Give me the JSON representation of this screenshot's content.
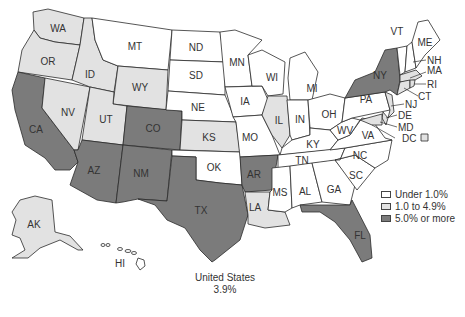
{
  "colors": {
    "low": "#ffffff",
    "mid": "#e2e2e2",
    "high": "#7b7b7b",
    "border": "#2b2b2b"
  },
  "legend": {
    "items": [
      {
        "label": "Under 1.0%",
        "category": "low"
      },
      {
        "label": "1.0 to 4.9%",
        "category": "mid"
      },
      {
        "label": "5.0% or more",
        "category": "high"
      }
    ]
  },
  "national": {
    "name": "United States",
    "value": "3.9%"
  },
  "states": {
    "WA": "mid",
    "OR": "mid",
    "CA": "high",
    "NV": "mid",
    "ID": "mid",
    "MT": "low",
    "WY": "mid",
    "UT": "mid",
    "AZ": "high",
    "CO": "high",
    "NM": "high",
    "ND": "low",
    "SD": "low",
    "NE": "low",
    "KS": "mid",
    "OK": "low",
    "TX": "high",
    "MN": "low",
    "IA": "low",
    "MO": "low",
    "AR": "high",
    "LA": "mid",
    "WI": "low",
    "IL": "mid",
    "MI": "low",
    "IN": "low",
    "OH": "low",
    "KY": "low",
    "TN": "low",
    "MS": "low",
    "AL": "low",
    "GA": "low",
    "FL": "high",
    "SC": "low",
    "NC": "low",
    "VA": "low",
    "WV": "low",
    "PA": "low",
    "NY": "high",
    "VT": "low",
    "NH": "low",
    "ME": "low",
    "MA": "mid",
    "RI": "mid",
    "CT": "mid",
    "NJ": "mid",
    "DE": "mid",
    "MD": "mid",
    "DC": "mid",
    "AK": "mid",
    "HI": "low"
  },
  "labels": {
    "WA": "WA",
    "OR": "OR",
    "CA": "CA",
    "NV": "NV",
    "ID": "ID",
    "MT": "MT",
    "WY": "WY",
    "UT": "UT",
    "AZ": "AZ",
    "CO": "CO",
    "NM": "NM",
    "ND": "ND",
    "SD": "SD",
    "NE": "NE",
    "KS": "KS",
    "OK": "OK",
    "TX": "TX",
    "MN": "MN",
    "IA": "IA",
    "MO": "MO",
    "AR": "AR",
    "LA": "LA",
    "WI": "WI",
    "IL": "IL",
    "MI": "MI",
    "IN": "IN",
    "OH": "OH",
    "KY": "KY",
    "TN": "TN",
    "MS": "MS",
    "AL": "AL",
    "GA": "GA",
    "FL": "FL",
    "SC": "SC",
    "NC": "NC",
    "VA": "VA",
    "WV": "WV",
    "PA": "PA",
    "NY": "NY",
    "VT": "VT",
    "NH": "NH",
    "ME": "ME",
    "MA": "MA",
    "RI": "RI",
    "CT": "CT",
    "NJ": "NJ",
    "DE": "DE",
    "MD": "MD",
    "DC": "DC",
    "AK": "AK",
    "HI": "HI"
  }
}
